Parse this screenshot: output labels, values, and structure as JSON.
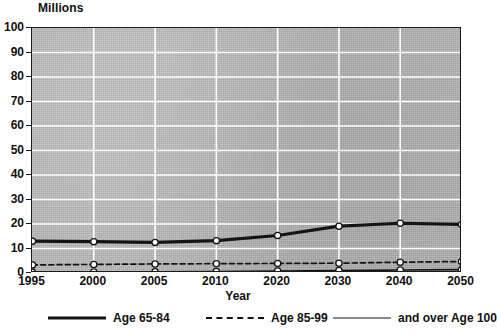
{
  "chart_data": {
    "type": "line",
    "title": "",
    "xlabel": "Year",
    "ylabel": "Millions",
    "ylim": [
      0,
      100
    ],
    "ytick_step": 10,
    "grid": true,
    "legend_position": "bottom",
    "categories": [
      "1995",
      "2000",
      "2005",
      "2010",
      "2020",
      "2030",
      "2040",
      "2050"
    ],
    "yticks": [
      "0",
      "10",
      "20",
      "30",
      "40",
      "50",
      "60",
      "70",
      "80",
      "90",
      "100"
    ],
    "series": [
      {
        "name": "Age 65-84",
        "style": "solid-thick",
        "values": [
          13.0,
          12.8,
          12.5,
          13.2,
          15.3,
          19.1,
          20.3,
          19.8
        ]
      },
      {
        "name": "Age 85-99",
        "style": "dashed",
        "values": [
          3.3,
          3.5,
          3.7,
          3.8,
          3.9,
          4.0,
          4.4,
          4.7
        ]
      },
      {
        "name": "and over Age 100",
        "style": "solid-thin",
        "values": [
          0.3,
          0.4,
          0.5,
          0.6,
          0.8,
          1.0,
          1.2,
          1.4
        ]
      }
    ]
  },
  "legend": {
    "entries": [
      {
        "label": "Age 65-84"
      },
      {
        "label": "Age 85-99"
      },
      {
        "label": "and over Age 100"
      }
    ]
  },
  "colors": {
    "line": "#141414",
    "plot_background": "#b4b4b4",
    "gridline": "#ffffff",
    "axis": "#1a1a1a",
    "marker_fill": "#ffffff"
  }
}
